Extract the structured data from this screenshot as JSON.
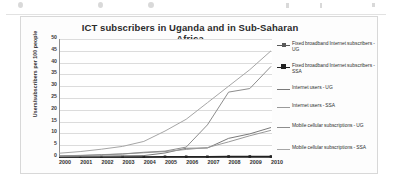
{
  "chart_data": {
    "type": "line",
    "title": "ICT subscribers in Uganda and in Sub-Saharan Africa",
    "xlabel": "",
    "ylabel": "Users/subscribers per 100 people",
    "x": [
      "2000",
      "2001",
      "2002",
      "2003",
      "2004",
      "2005",
      "2006",
      "2007",
      "2008",
      "2009",
      "2010"
    ],
    "ylim": [
      0,
      50
    ],
    "yticks": [
      "0",
      "5",
      "10",
      "15",
      "20",
      "25",
      "30",
      "35",
      "40",
      "45",
      "50"
    ],
    "grid": true,
    "legend_position": "right",
    "series": [
      {
        "name": "Fixed broadband Internet subscribers - UG",
        "color": "#5a5a5a",
        "marker": "square-small",
        "values": [
          0.0,
          0.0,
          0.0,
          0.0,
          0.0,
          0.0,
          0.0,
          0.0,
          0.1,
          0.1,
          0.1
        ]
      },
      {
        "name": "Fixed broadband Internet subscribers - SSA",
        "color": "#222222",
        "marker": "square",
        "values": [
          0.0,
          0.0,
          0.0,
          0.0,
          0.0,
          0.1,
          0.1,
          0.1,
          0.2,
          0.2,
          0.2
        ]
      },
      {
        "name": "Internet users - UG",
        "color": "#7a7a7a",
        "marker": "none",
        "values": [
          0.2,
          0.3,
          0.4,
          0.5,
          0.6,
          1.7,
          3.7,
          3.8,
          7.9,
          9.8,
          12.5
        ]
      },
      {
        "name": "Internet users - SSA",
        "color": "#9a9a9a",
        "marker": "none",
        "values": [
          0.5,
          0.7,
          1.0,
          1.3,
          1.8,
          2.3,
          3.2,
          4.0,
          6.4,
          9.0,
          11.3
        ]
      },
      {
        "name": "Mobile cellular subscriptions - UG",
        "color": "#8d8d8d",
        "marker": "none",
        "values": [
          0.5,
          0.6,
          0.9,
          1.3,
          2.0,
          2.5,
          4.2,
          13.6,
          27.5,
          29.0,
          38.4
        ]
      },
      {
        "name": "Mobile cellular subscriptions - SSA",
        "color": "#a6a6a6",
        "marker": "none",
        "values": [
          1.6,
          2.3,
          3.3,
          4.5,
          6.6,
          11.0,
          16.0,
          23.0,
          30.0,
          37.0,
          45.0
        ]
      }
    ]
  },
  "legend": {
    "items": [
      "Fixed broadband Internet subscribers - UG",
      "Fixed broadband Internet subscribers - SSA",
      "Internet users - UG",
      "Internet users - SSA",
      "Mobile cellular subscriptions - UG",
      "Mobile cellular subscriptions - SSA"
    ]
  }
}
